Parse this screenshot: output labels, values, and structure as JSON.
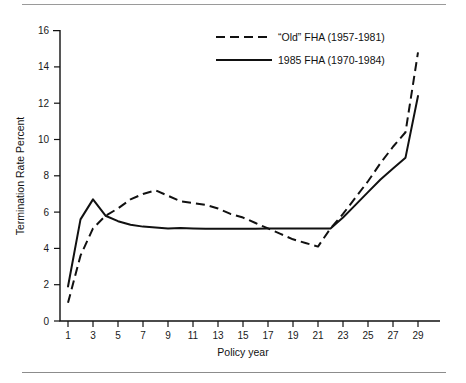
{
  "chart_data": {
    "type": "line",
    "title": "",
    "subtitle": "",
    "xlabel": "Policy year",
    "ylabel": "Termination Rate Percent",
    "xlim": [
      0,
      30
    ],
    "ylim": [
      0,
      16
    ],
    "xticks": [
      1,
      3,
      5,
      7,
      9,
      11,
      13,
      15,
      17,
      19,
      21,
      23,
      25,
      27,
      29
    ],
    "yticks": [
      0,
      2,
      4,
      6,
      8,
      10,
      12,
      14,
      16
    ],
    "xtick_labels": [
      "1",
      "3",
      "5",
      "7",
      "9",
      "11",
      "13",
      "15",
      "17",
      "19",
      "21",
      "23",
      "25",
      "27",
      "29"
    ],
    "ytick_labels": [
      "0",
      "2",
      "4",
      "6",
      "8",
      "10",
      "12",
      "14",
      "16"
    ],
    "grid": false,
    "legend_position": "top-right",
    "x": [
      1,
      2,
      3,
      4,
      5,
      6,
      7,
      8,
      9,
      10,
      11,
      12,
      13,
      14,
      15,
      16,
      17,
      18,
      19,
      20,
      21,
      22,
      23,
      24,
      25,
      26,
      27,
      28,
      29
    ],
    "series": [
      {
        "name": "“Old” FHA (1957-1981)",
        "style": "dashed",
        "color": "#111111",
        "values": [
          1.0,
          3.6,
          5.1,
          5.8,
          6.2,
          6.7,
          7.0,
          7.2,
          6.9,
          6.6,
          6.5,
          6.4,
          6.2,
          5.9,
          5.7,
          5.4,
          5.1,
          4.8,
          4.5,
          4.3,
          4.1,
          5.1,
          5.9,
          6.8,
          7.7,
          8.7,
          9.6,
          10.4,
          14.8
        ]
      },
      {
        "name": "1985 FHA (1970-1984)",
        "style": "solid",
        "color": "#111111",
        "values": [
          1.9,
          5.6,
          6.7,
          5.8,
          5.5,
          5.3,
          5.2,
          5.15,
          5.1,
          5.12,
          5.1,
          5.08,
          5.08,
          5.08,
          5.08,
          5.08,
          5.1,
          5.1,
          5.1,
          5.1,
          5.1,
          5.1,
          5.7,
          6.4,
          7.1,
          7.8,
          8.4,
          9.0,
          12.4
        ]
      }
    ],
    "legend": [
      {
        "label": "“Old” FHA (1957-1981)",
        "style": "dashed"
      },
      {
        "label": "1985 FHA (1970-1984)",
        "style": "solid"
      }
    ],
    "annotations": []
  },
  "figure": {
    "top_rule": "horizontal-rule",
    "bottom_rule": "horizontal-rule"
  }
}
